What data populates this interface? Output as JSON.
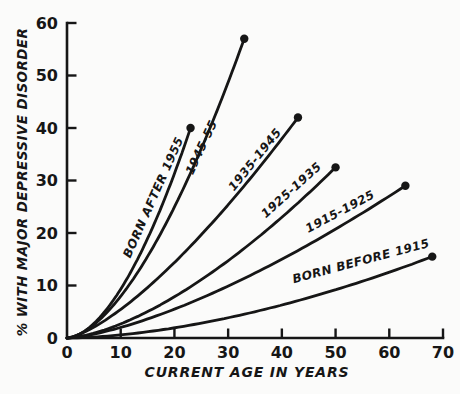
{
  "figure": {
    "background_color": "#fbfbfa",
    "ink_color": "#161616"
  },
  "chart_data": {
    "type": "line",
    "title": "",
    "xlabel": "CURRENT AGE IN YEARS",
    "ylabel": "% WITH MAJOR DEPRESSIVE DISORDER",
    "xlim": [
      0,
      70
    ],
    "ylim": [
      0,
      60
    ],
    "xticks": [
      0,
      10,
      20,
      30,
      40,
      50,
      60,
      70
    ],
    "yticks": [
      0,
      10,
      20,
      30,
      40,
      50,
      60
    ],
    "grid": false,
    "legend_position": "labels-along-curves",
    "marker": "filled-dot-at-curve-end",
    "series": [
      {
        "id": "born-after-1955",
        "label": "BORN AFTER 1955",
        "end": [
          23,
          40
        ],
        "exponent": 1.75,
        "points": [
          [
            0,
            0
          ],
          [
            5,
            2.8
          ],
          [
            10,
            9.3
          ],
          [
            15,
            18.9
          ],
          [
            20,
            31.3
          ],
          [
            23,
            40
          ]
        ],
        "label_pos": {
          "x": 157,
          "y": 199,
          "angle": -66
        }
      },
      {
        "id": "1945-55",
        "label": "1945-55",
        "end": [
          33,
          57
        ],
        "exponent": 1.65,
        "points": [
          [
            0,
            0
          ],
          [
            10,
            7.9
          ],
          [
            20,
            24.9
          ],
          [
            30,
            48.7
          ],
          [
            33,
            57
          ]
        ],
        "label_pos": {
          "x": 205,
          "y": 149,
          "angle": -65
        }
      },
      {
        "id": "1935-1945",
        "label": "1935-1945",
        "end": [
          43,
          42
        ],
        "exponent": 1.4,
        "points": [
          [
            0,
            0
          ],
          [
            10,
            5.5
          ],
          [
            20,
            14.4
          ],
          [
            30,
            25.4
          ],
          [
            40,
            38.0
          ],
          [
            43,
            42
          ]
        ],
        "label_pos": {
          "x": 258,
          "y": 162,
          "angle": -51
        }
      },
      {
        "id": "1925-1935",
        "label": "1925-1935",
        "end": [
          50,
          32.5
        ],
        "exponent": 1.55,
        "points": [
          [
            0,
            0
          ],
          [
            10,
            2.7
          ],
          [
            20,
            7.9
          ],
          [
            30,
            14.7
          ],
          [
            40,
            23.0
          ],
          [
            50,
            32.5
          ]
        ],
        "label_pos": {
          "x": 294,
          "y": 193,
          "angle": -42
        }
      },
      {
        "id": "1915-1925",
        "label": "1915-1925",
        "end": [
          63,
          29
        ],
        "exponent": 1.45,
        "points": [
          [
            0,
            0
          ],
          [
            10,
            2.0
          ],
          [
            20,
            5.5
          ],
          [
            30,
            9.9
          ],
          [
            40,
            15.0
          ],
          [
            50,
            20.7
          ],
          [
            60,
            27.0
          ],
          [
            63,
            29
          ]
        ],
        "label_pos": {
          "x": 342,
          "y": 215,
          "angle": -28
        }
      },
      {
        "id": "born-before-1915",
        "label": "BORN BEFORE 1915",
        "end": [
          68,
          15.5
        ],
        "exponent": 1.7,
        "points": [
          [
            0,
            0
          ],
          [
            10,
            0.6
          ],
          [
            20,
            1.9
          ],
          [
            30,
            3.9
          ],
          [
            40,
            6.3
          ],
          [
            50,
            9.2
          ],
          [
            60,
            12.5
          ],
          [
            68,
            15.5
          ]
        ],
        "label_pos": {
          "x": 362,
          "y": 265,
          "angle": -15
        }
      }
    ]
  }
}
